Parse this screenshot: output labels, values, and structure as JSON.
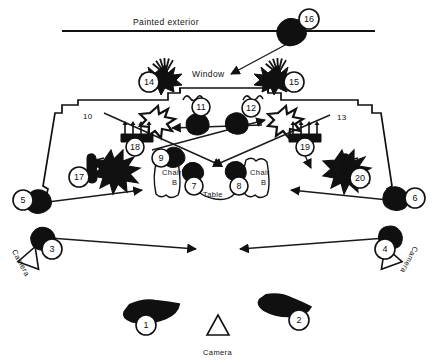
{
  "diagram": {
    "title_text": "Painted exterior",
    "window_label": "Window",
    "table_label": "Table",
    "chair_left_label": "Chair\nB",
    "chair_right_label": "Chair\nB",
    "camera_label": "Camera",
    "colors": {
      "ink": "#111111",
      "paper": "#ffffff",
      "evidence_fill": "#101010",
      "line": "#1a1a1a"
    }
  },
  "plain_labels": [
    {
      "name": "painted-exterior-label",
      "text": "Painted exterior",
      "x": 133,
      "y": 17,
      "cls": "lbl-exterior"
    },
    {
      "name": "window-label",
      "text": "Window",
      "x": 192,
      "y": 69,
      "cls": "lbl-window"
    },
    {
      "name": "marker-10-label",
      "text": "10",
      "x": 83,
      "y": 112,
      "cls": "lbl-num"
    },
    {
      "name": "marker-13-label",
      "text": "13",
      "x": 337,
      "y": 113,
      "cls": "lbl-num"
    },
    {
      "name": "chair-left-label",
      "text": "Chair",
      "x": 162,
      "y": 168,
      "cls": "lbl-furn"
    },
    {
      "name": "chair-left-label-b",
      "text": "B",
      "x": 172,
      "y": 178,
      "cls": "lbl-furn"
    },
    {
      "name": "chair-right-label",
      "text": "Chair",
      "x": 250,
      "y": 168,
      "cls": "lbl-furn"
    },
    {
      "name": "chair-right-label-b",
      "text": "B",
      "x": 261,
      "y": 178,
      "cls": "lbl-furn"
    },
    {
      "name": "table-label",
      "text": "Table",
      "x": 203,
      "y": 190,
      "cls": "lbl-furn"
    },
    {
      "name": "camera-bottom-label",
      "text": "Camera",
      "x": 203,
      "y": 348,
      "cls": "lbl-camera"
    }
  ],
  "rotated_labels": [
    {
      "name": "camera-left-label",
      "text": "Camera",
      "x": 18,
      "y": 248,
      "rotate": 62
    },
    {
      "name": "camera-right-label",
      "text": "Camera",
      "x": 420,
      "y": 249,
      "rotate": 118
    }
  ],
  "markers": [
    {
      "id": "1",
      "cx": 146,
      "cy": 325,
      "r": 10,
      "evidence": "debris-blob",
      "ex": 155,
      "ey": 309,
      "erot": -8,
      "escale": 1.55
    },
    {
      "id": "2",
      "cx": 299,
      "cy": 320,
      "r": 10,
      "evidence": "debris-blob",
      "ex": 288,
      "ey": 305,
      "erot": 8,
      "escale": 1.45
    },
    {
      "id": "3",
      "cx": 52,
      "cy": 249,
      "r": 10,
      "evidence": "shoe-print",
      "ex": 44,
      "ey": 236,
      "erot": -18,
      "escale": 1.0
    },
    {
      "id": "4",
      "cx": 385,
      "cy": 249,
      "r": 10,
      "evidence": "shoe-print",
      "ex": 393,
      "ey": 236,
      "erot": 18,
      "escale": 1.0
    },
    {
      "id": "5",
      "cx": 23,
      "cy": 200,
      "r": 10,
      "evidence": "shoe-print",
      "ex": 40,
      "ey": 199,
      "erot": -12,
      "escale": 1.05
    },
    {
      "id": "6",
      "cx": 415,
      "cy": 198,
      "r": 10,
      "evidence": "shoe-print",
      "ex": 398,
      "ey": 197,
      "erot": 12,
      "escale": 1.05
    },
    {
      "id": "7",
      "cx": 194,
      "cy": 186,
      "r": 9,
      "evidence": "shoe-print",
      "ex": 194,
      "ey": 170,
      "erot": -14,
      "escale": 0.88
    },
    {
      "id": "8",
      "cx": 239,
      "cy": 186,
      "r": 9,
      "evidence": "shoe-print",
      "ex": 238,
      "ey": 170,
      "erot": 14,
      "escale": 0.88
    },
    {
      "id": "9",
      "cx": 161,
      "cy": 158,
      "r": 9,
      "evidence": "shoe-print",
      "ex": 175,
      "ey": 155,
      "erot": -16,
      "escale": 0.9
    },
    {
      "id": "11",
      "cx": 201,
      "cy": 107,
      "r": 9,
      "evidence": "shoe-print",
      "ex": 199,
      "ey": 122,
      "erot": -10,
      "escale": 0.95
    },
    {
      "id": "12",
      "cx": 251,
      "cy": 108,
      "r": 9,
      "evidence": "shoe-print",
      "ex": 239,
      "ey": 122,
      "erot": 10,
      "escale": 0.95
    },
    {
      "id": "14",
      "cx": 149,
      "cy": 82,
      "r": 10,
      "evidence": "splatter-burst",
      "ex": 165,
      "ey": 78,
      "erot": 0,
      "escale": 1.0
    },
    {
      "id": "15",
      "cx": 294,
      "cy": 82,
      "r": 10,
      "evidence": "splatter-burst",
      "ex": 278,
      "ey": 78,
      "erot": 0,
      "escale": 1.0
    },
    {
      "id": "16",
      "cx": 309,
      "cy": 19,
      "r": 10,
      "evidence": "shoe-print",
      "ex": 293,
      "ey": 29,
      "erot": -16,
      "escale": 1.2
    },
    {
      "id": "17",
      "cx": 79,
      "cy": 177,
      "r": 10,
      "evidence": "knife",
      "ex": 93,
      "ey": 168,
      "erot": 0,
      "escale": 1.0
    },
    {
      "id": "18",
      "cx": 135,
      "cy": 147,
      "r": 9,
      "evidence": "comb-rake",
      "ex": 137,
      "ey": 136,
      "erot": 0,
      "escale": 1.0
    },
    {
      "id": "19",
      "cx": 305,
      "cy": 147,
      "r": 9,
      "evidence": "comb-rake",
      "ex": 305,
      "ey": 136,
      "erot": 0,
      "escale": 1.0
    },
    {
      "id": "20",
      "cx": 360,
      "cy": 178,
      "r": 10,
      "evidence": "knife",
      "ex": 347,
      "ey": 168,
      "erot": 0,
      "escale": 1.0
    }
  ],
  "cameras": [
    {
      "name": "camera-left",
      "x": 31,
      "y": 258,
      "rotate": 20
    },
    {
      "name": "camera-right",
      "x": 389,
      "y": 258,
      "rotate": -20
    },
    {
      "name": "camera-bottom",
      "x": 218,
      "y": 327,
      "rotate": 0
    }
  ],
  "arrows": [
    {
      "name": "arrow-16-to-room",
      "x1": 302,
      "y1": 36,
      "x2": 231,
      "y2": 74
    },
    {
      "name": "arrow-camera3-right",
      "x1": 50,
      "y1": 238,
      "x2": 196,
      "y2": 249
    },
    {
      "name": "arrow-5-to-table",
      "x1": 40,
      "y1": 203,
      "x2": 142,
      "y2": 190
    },
    {
      "name": "arrow-camera4-left",
      "x1": 386,
      "y1": 238,
      "x2": 240,
      "y2": 249
    },
    {
      "name": "arrow-6-to-room",
      "x1": 398,
      "y1": 201,
      "x2": 291,
      "y2": 190
    },
    {
      "name": "arrow-10-to-center",
      "x1": 104,
      "y1": 113,
      "x2": 222,
      "y2": 166
    },
    {
      "name": "arrow-13-to-center",
      "x1": 330,
      "y1": 115,
      "x2": 213,
      "y2": 166
    },
    {
      "name": "arrow-9-to-right",
      "x1": 152,
      "y1": 150,
      "x2": 265,
      "y2": 120
    },
    {
      "name": "arrow-12-to-left",
      "x1": 262,
      "y1": 125,
      "x2": 172,
      "y2": 128
    },
    {
      "name": "arrow-19-to-down",
      "x1": 297,
      "y1": 139,
      "x2": 311,
      "y2": 168
    }
  ]
}
